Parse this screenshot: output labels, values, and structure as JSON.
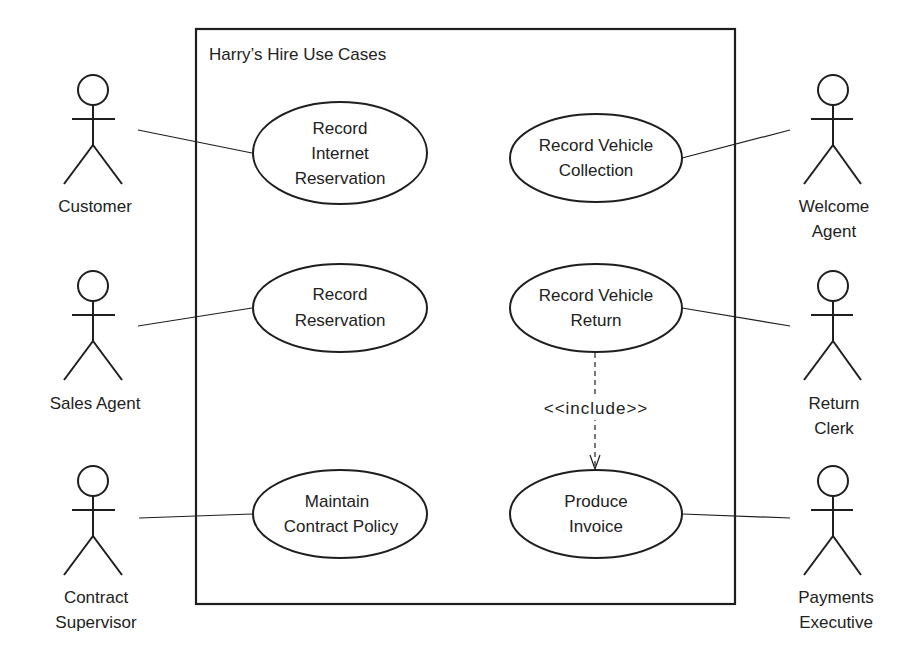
{
  "system": {
    "title": "Harry’s Hire Use Cases"
  },
  "actors": [
    {
      "id": "customer",
      "lines": [
        "Customer"
      ]
    },
    {
      "id": "sales-agent",
      "lines": [
        "Sales Agent"
      ]
    },
    {
      "id": "contract-supervisor",
      "lines": [
        "Contract",
        "Supervisor"
      ]
    },
    {
      "id": "welcome-agent",
      "lines": [
        "Welcome",
        "Agent"
      ]
    },
    {
      "id": "return-clerk",
      "lines": [
        "Return",
        "Clerk"
      ]
    },
    {
      "id": "payments-executive",
      "lines": [
        "Payments",
        "Executive"
      ]
    }
  ],
  "use_cases": [
    {
      "id": "record-internet-reservation",
      "lines": [
        "Record",
        "Internet",
        "Reservation"
      ]
    },
    {
      "id": "record-reservation",
      "lines": [
        "Record",
        "Reservation"
      ]
    },
    {
      "id": "maintain-contract-policy",
      "lines": [
        "Maintain",
        "Contract Policy"
      ]
    },
    {
      "id": "record-vehicle-collection",
      "lines": [
        "Record Vehicle",
        "Collection"
      ]
    },
    {
      "id": "record-vehicle-return",
      "lines": [
        "Record Vehicle",
        "Return"
      ]
    },
    {
      "id": "produce-invoice",
      "lines": [
        "Produce",
        "Invoice"
      ]
    }
  ],
  "relationships": {
    "include_label": "<<include>>",
    "associations": [
      [
        "Customer",
        "Record Internet Reservation"
      ],
      [
        "Sales Agent",
        "Record Reservation"
      ],
      [
        "Contract Supervisor",
        "Maintain Contract Policy"
      ],
      [
        "Welcome Agent",
        "Record Vehicle Collection"
      ],
      [
        "Return Clerk",
        "Record Vehicle Return"
      ],
      [
        "Payments Executive",
        "Produce Invoice"
      ]
    ],
    "includes": [
      [
        "Record Vehicle Return",
        "Produce Invoice"
      ]
    ]
  }
}
